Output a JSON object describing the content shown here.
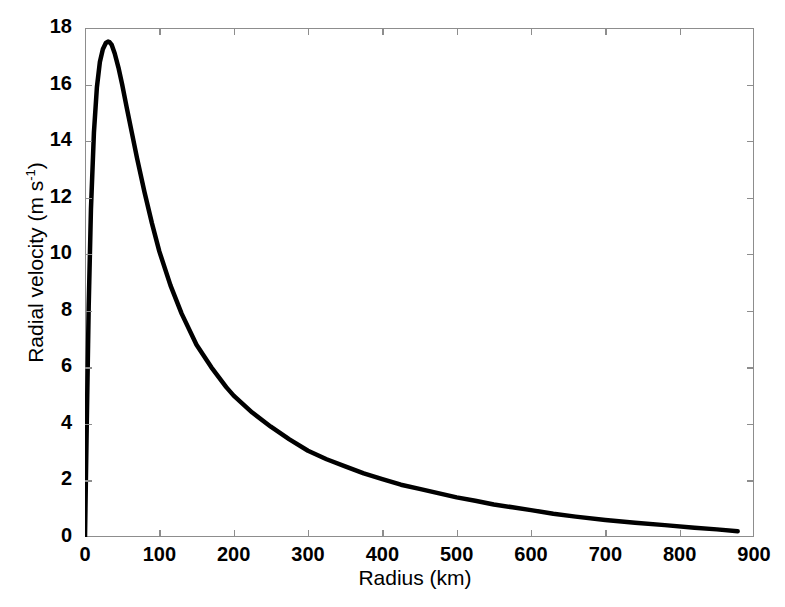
{
  "chart_data": {
    "type": "line",
    "title": "",
    "xlabel": "Radius (km)",
    "ylabel_parts": {
      "prefix": "Radial velocity (m s",
      "sup": "-1",
      "suffix": ")"
    },
    "ylabel": "Radial velocity (m s-1)",
    "xlim": [
      0,
      900
    ],
    "ylim": [
      0,
      18
    ],
    "xticks": [
      0,
      100,
      200,
      300,
      400,
      500,
      600,
      700,
      800,
      900
    ],
    "yticks": [
      0,
      2,
      4,
      6,
      8,
      10,
      12,
      14,
      16,
      18
    ],
    "grid": false,
    "legend": null,
    "line_color": "#000000",
    "line_width": 4,
    "axis_color": "#8d8d8d",
    "background": "#ffffff",
    "series": [
      {
        "name": "Radial velocity profile",
        "x": [
          0,
          2,
          5,
          8,
          12,
          16,
          20,
          24,
          28,
          31,
          33,
          36,
          40,
          45,
          50,
          56,
          63,
          70,
          80,
          90,
          100,
          115,
          130,
          150,
          170,
          190,
          200,
          225,
          250,
          275,
          300,
          325,
          350,
          375,
          400,
          425,
          450,
          475,
          500,
          525,
          550,
          575,
          600,
          630,
          660,
          700,
          740,
          780,
          820,
          850,
          878
        ],
        "y": [
          0.0,
          3.4,
          8.2,
          11.6,
          14.3,
          15.9,
          16.8,
          17.25,
          17.47,
          17.52,
          17.5,
          17.4,
          17.1,
          16.6,
          16.0,
          15.2,
          14.3,
          13.4,
          12.2,
          11.1,
          10.1,
          8.9,
          7.9,
          6.8,
          6.0,
          5.3,
          5.0,
          4.4,
          3.9,
          3.45,
          3.05,
          2.75,
          2.5,
          2.25,
          2.05,
          1.85,
          1.7,
          1.55,
          1.4,
          1.28,
          1.15,
          1.05,
          0.95,
          0.82,
          0.72,
          0.6,
          0.5,
          0.42,
          0.33,
          0.27,
          0.2
        ]
      }
    ]
  },
  "axis": {
    "x_tick_labels": [
      "0",
      "100",
      "200",
      "300",
      "400",
      "500",
      "600",
      "700",
      "800",
      "900"
    ],
    "y_tick_labels": [
      "0",
      "2",
      "4",
      "6",
      "8",
      "10",
      "12",
      "14",
      "16",
      "18"
    ]
  }
}
